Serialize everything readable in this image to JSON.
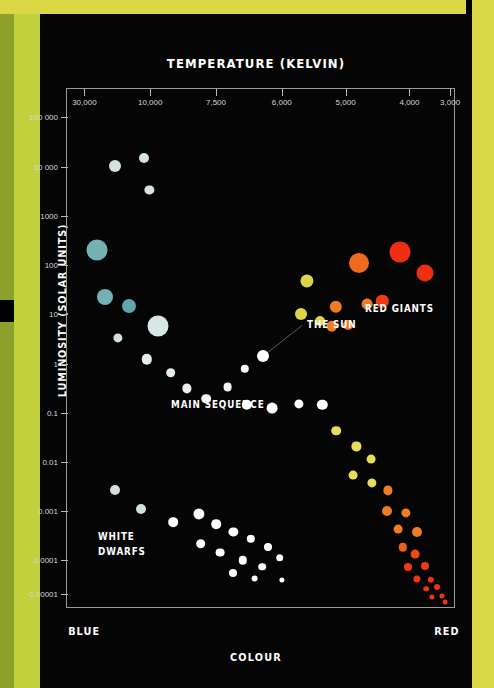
{
  "poster": {
    "background": "#000000",
    "band_top_color": "#d9d844",
    "band_left_color": "#c3d03e",
    "band_left_edge_color": "#8ea02c",
    "band_right_color": "#d9d844"
  },
  "chart_data": {
    "type": "scatter",
    "title": "TEMPERATURE (KELVIN)",
    "xlabel": "COLOUR",
    "ylabel": "LUMINOSITY (SOLAR UNITS)",
    "x_axis_position": "top",
    "x_axis_direction": "decreasing",
    "x_left_end_label": "BLUE",
    "x_right_end_label": "RED",
    "xticks": [
      "30,000",
      "10,000",
      "7,500",
      "6,000",
      "5,000",
      "4,000",
      "3,000"
    ],
    "xtick_positions_pct": [
      4.5,
      21.5,
      38.5,
      55.5,
      72.0,
      88.5,
      99.0
    ],
    "yticks": [
      "100 000",
      "10 000",
      "1000",
      "100",
      "10",
      "1",
      "0.1",
      "0.01",
      "0.001",
      "0.0001",
      "0.00001"
    ],
    "ytick_positions_pct": [
      5.5,
      15.0,
      24.5,
      34.0,
      43.5,
      53.0,
      62.5,
      72.0,
      81.5,
      91.0,
      97.5
    ],
    "grid": false,
    "legend": "none",
    "annotations": [
      {
        "name": "the-sun",
        "text": "THE SUN",
        "x_pct": 62.0,
        "y_pct": 44.0
      },
      {
        "name": "main-sequence",
        "text": "MAIN SEQUENCE",
        "x_pct": 27.0,
        "y_pct": 59.5
      },
      {
        "name": "red-giants",
        "text": "RED GIANTS",
        "x_pct": 77.0,
        "y_pct": 41.0
      },
      {
        "name": "white-dwarfs",
        "text": "WHITE\nDWARFS",
        "x_pct": 8.0,
        "y_pct": 85.0
      }
    ],
    "sun_leader_line": {
      "x1_pct": 60.8,
      "y1_pct": 45.6,
      "x2_pct": 50.6,
      "y2_pct": 51.6
    },
    "series": [
      {
        "name": "supergiants",
        "points": [
          {
            "x_pct": 12.5,
            "y_pct": 14.8,
            "r": 6.0,
            "color": "#d2e2e0"
          },
          {
            "x_pct": 20.0,
            "y_pct": 13.3,
            "r": 5.0,
            "color": "#d6e5e3"
          },
          {
            "x_pct": 21.3,
            "y_pct": 19.5,
            "r": 4.6,
            "color": "#d6e5e3"
          }
        ]
      },
      {
        "name": "main-sequence",
        "points": [
          {
            "x_pct": 7.7,
            "y_pct": 31.0,
            "r": 10.5,
            "color": "#74b0b4"
          },
          {
            "x_pct": 9.8,
            "y_pct": 40.2,
            "r": 8.0,
            "color": "#74b0b4"
          },
          {
            "x_pct": 16.0,
            "y_pct": 41.8,
            "r": 7.0,
            "color": "#5fa7ad"
          },
          {
            "x_pct": 13.2,
            "y_pct": 48.0,
            "r": 4.6,
            "color": "#cfe2e1"
          },
          {
            "x_pct": 23.5,
            "y_pct": 45.8,
            "r": 10.5,
            "color": "#d8e7e5"
          },
          {
            "x_pct": 20.6,
            "y_pct": 52.2,
            "r": 5.2,
            "color": "#e6eeec"
          },
          {
            "x_pct": 26.8,
            "y_pct": 54.8,
            "r": 4.8,
            "color": "#e6eeec"
          },
          {
            "x_pct": 31.0,
            "y_pct": 57.8,
            "r": 4.6,
            "color": "#eef3f1"
          },
          {
            "x_pct": 36.0,
            "y_pct": 59.8,
            "r": 4.8,
            "color": "#f2f5f3"
          },
          {
            "x_pct": 41.5,
            "y_pct": 57.6,
            "r": 4.4,
            "color": "#f5f7f5"
          },
          {
            "x_pct": 46.0,
            "y_pct": 54.0,
            "r": 4.2,
            "color": "#ffffff"
          },
          {
            "x_pct": 50.6,
            "y_pct": 51.6,
            "r": 6.0,
            "color": "#ffffff"
          },
          {
            "x_pct": 46.5,
            "y_pct": 61.0,
            "r": 5.2,
            "color": "#ffffff"
          },
          {
            "x_pct": 53.0,
            "y_pct": 61.6,
            "r": 5.4,
            "color": "#ffffff"
          },
          {
            "x_pct": 60.0,
            "y_pct": 60.8,
            "r": 4.6,
            "color": "#ffffff"
          },
          {
            "x_pct": 66.0,
            "y_pct": 61.0,
            "r": 5.2,
            "color": "#ffffff"
          },
          {
            "x_pct": 69.5,
            "y_pct": 66.0,
            "r": 4.8,
            "color": "#e9dc5b"
          },
          {
            "x_pct": 74.8,
            "y_pct": 69.0,
            "r": 4.6,
            "color": "#e9dc5b"
          },
          {
            "x_pct": 78.5,
            "y_pct": 71.5,
            "r": 4.4,
            "color": "#e9dc5b"
          },
          {
            "x_pct": 74.0,
            "y_pct": 74.5,
            "r": 4.4,
            "color": "#e9dc5b"
          },
          {
            "x_pct": 78.8,
            "y_pct": 76.0,
            "r": 4.6,
            "color": "#e9dc5b"
          },
          {
            "x_pct": 83.0,
            "y_pct": 77.5,
            "r": 4.6,
            "color": "#ef7b22"
          },
          {
            "x_pct": 82.6,
            "y_pct": 81.5,
            "r": 5.0,
            "color": "#ef7b22"
          },
          {
            "x_pct": 87.5,
            "y_pct": 81.8,
            "r": 4.6,
            "color": "#ef7b22"
          },
          {
            "x_pct": 85.5,
            "y_pct": 85.0,
            "r": 4.4,
            "color": "#ef7b22"
          },
          {
            "x_pct": 90.5,
            "y_pct": 85.5,
            "r": 5.0,
            "color": "#ef7b22"
          },
          {
            "x_pct": 86.8,
            "y_pct": 88.5,
            "r": 4.2,
            "color": "#ee5f1e"
          },
          {
            "x_pct": 90.0,
            "y_pct": 89.8,
            "r": 4.4,
            "color": "#ee4a18"
          },
          {
            "x_pct": 88.0,
            "y_pct": 92.2,
            "r": 4.0,
            "color": "#ee3a15"
          },
          {
            "x_pct": 92.5,
            "y_pct": 92.0,
            "r": 4.0,
            "color": "#ee3a15"
          },
          {
            "x_pct": 90.5,
            "y_pct": 94.5,
            "r": 3.6,
            "color": "#ee3212"
          },
          {
            "x_pct": 94.0,
            "y_pct": 94.8,
            "r": 3.2,
            "color": "#ee3212"
          },
          {
            "x_pct": 95.5,
            "y_pct": 96.2,
            "r": 3.0,
            "color": "#ee3212"
          },
          {
            "x_pct": 92.8,
            "y_pct": 96.5,
            "r": 2.8,
            "color": "#ee3212"
          },
          {
            "x_pct": 94.2,
            "y_pct": 98.0,
            "r": 2.6,
            "color": "#ee3212"
          },
          {
            "x_pct": 96.8,
            "y_pct": 97.8,
            "r": 2.6,
            "color": "#ee3212"
          },
          {
            "x_pct": 97.8,
            "y_pct": 99.0,
            "r": 2.4,
            "color": "#ee3212"
          }
        ]
      },
      {
        "name": "red-giants",
        "points": [
          {
            "x_pct": 62.0,
            "y_pct": 37.0,
            "r": 6.6,
            "color": "#dcd44a"
          },
          {
            "x_pct": 60.5,
            "y_pct": 43.5,
            "r": 6.0,
            "color": "#dcd44a"
          },
          {
            "x_pct": 65.5,
            "y_pct": 44.8,
            "r": 5.0,
            "color": "#dcd44a"
          },
          {
            "x_pct": 69.5,
            "y_pct": 42.0,
            "r": 6.2,
            "color": "#ef7b22"
          },
          {
            "x_pct": 68.5,
            "y_pct": 45.8,
            "r": 5.2,
            "color": "#ef7b22"
          },
          {
            "x_pct": 72.5,
            "y_pct": 45.6,
            "r": 5.0,
            "color": "#ef7b22"
          },
          {
            "x_pct": 75.5,
            "y_pct": 33.5,
            "r": 10.0,
            "color": "#ef6a1e"
          },
          {
            "x_pct": 77.5,
            "y_pct": 41.5,
            "r": 5.4,
            "color": "#ef7b22"
          },
          {
            "x_pct": 81.5,
            "y_pct": 41.0,
            "r": 6.2,
            "color": "#ee3a15"
          },
          {
            "x_pct": 86.0,
            "y_pct": 31.5,
            "r": 10.5,
            "color": "#ee2f12"
          },
          {
            "x_pct": 92.5,
            "y_pct": 35.5,
            "r": 8.5,
            "color": "#ee2f12"
          }
        ]
      },
      {
        "name": "white-dwarfs",
        "points": [
          {
            "x_pct": 12.5,
            "y_pct": 77.5,
            "r": 5.0,
            "color": "#cfe0de"
          },
          {
            "x_pct": 19.0,
            "y_pct": 81.0,
            "r": 5.0,
            "color": "#cfe0de"
          },
          {
            "x_pct": 27.5,
            "y_pct": 83.6,
            "r": 4.8,
            "color": "#ffffff"
          },
          {
            "x_pct": 34.0,
            "y_pct": 82.0,
            "r": 5.6,
            "color": "#ffffff"
          },
          {
            "x_pct": 38.5,
            "y_pct": 84.0,
            "r": 4.8,
            "color": "#ffffff"
          },
          {
            "x_pct": 43.0,
            "y_pct": 85.5,
            "r": 4.6,
            "color": "#ffffff"
          },
          {
            "x_pct": 47.5,
            "y_pct": 86.8,
            "r": 4.2,
            "color": "#ffffff"
          },
          {
            "x_pct": 52.0,
            "y_pct": 88.5,
            "r": 4.0,
            "color": "#ffffff"
          },
          {
            "x_pct": 34.5,
            "y_pct": 87.8,
            "r": 4.8,
            "color": "#ffffff"
          },
          {
            "x_pct": 39.5,
            "y_pct": 89.5,
            "r": 4.4,
            "color": "#ffffff"
          },
          {
            "x_pct": 45.5,
            "y_pct": 91.0,
            "r": 4.2,
            "color": "#ffffff"
          },
          {
            "x_pct": 50.5,
            "y_pct": 92.2,
            "r": 3.8,
            "color": "#ffffff"
          },
          {
            "x_pct": 55.0,
            "y_pct": 90.5,
            "r": 3.8,
            "color": "#ffffff"
          },
          {
            "x_pct": 43.0,
            "y_pct": 93.5,
            "r": 4.0,
            "color": "#ffffff"
          },
          {
            "x_pct": 48.5,
            "y_pct": 94.5,
            "r": 3.4,
            "color": "#ffffff"
          },
          {
            "x_pct": 55.5,
            "y_pct": 94.8,
            "r": 2.6,
            "color": "#ffffff"
          }
        ]
      }
    ]
  }
}
